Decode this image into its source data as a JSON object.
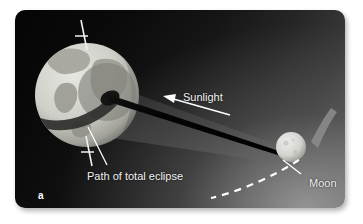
{
  "figure": {
    "panel_letter": "a",
    "background_color": "#ffffff"
  },
  "panel": {
    "corner_radius_px": 10,
    "gradient_dark": "#050505",
    "gradient_light": "#6e6e6e"
  },
  "labels": {
    "sunlight": "Sunlight",
    "path_of_total_eclipse": "Path of total eclipse",
    "moon": "Moon",
    "panel_letter": "a"
  },
  "objects": {
    "earth": {
      "name": "Earth",
      "center_x": 87,
      "center_y": 95,
      "radius": 52,
      "body_color": "#d7d7d2",
      "ocean_color": "#c6c6c0",
      "land_color": "#9a9a93",
      "axis_color": "#f0f0f0"
    },
    "moon": {
      "name": "Moon",
      "center_x": 291,
      "center_y": 147,
      "radius": 15,
      "body_color": "#d8d8d4"
    },
    "umbra_shadow": {
      "name": "umbra-cone",
      "color": "#000000"
    },
    "penumbra_shadow": {
      "name": "penumbra-cone",
      "color": "#3b3b3b"
    },
    "moon_orbit": {
      "name": "moon-orbit-dashed",
      "color": "#ffffff",
      "style": "dashed"
    },
    "orbit_arc_streak": {
      "name": "orbit-arc-streak",
      "color": "#8d8d8d"
    }
  },
  "annotations": {
    "sunlight_arrow": {
      "direction": "left",
      "color": "#ffffff"
    },
    "path_leader_line": {
      "color": "#ffffff"
    },
    "moon_leader_line": {
      "color": "#ffffff"
    }
  }
}
